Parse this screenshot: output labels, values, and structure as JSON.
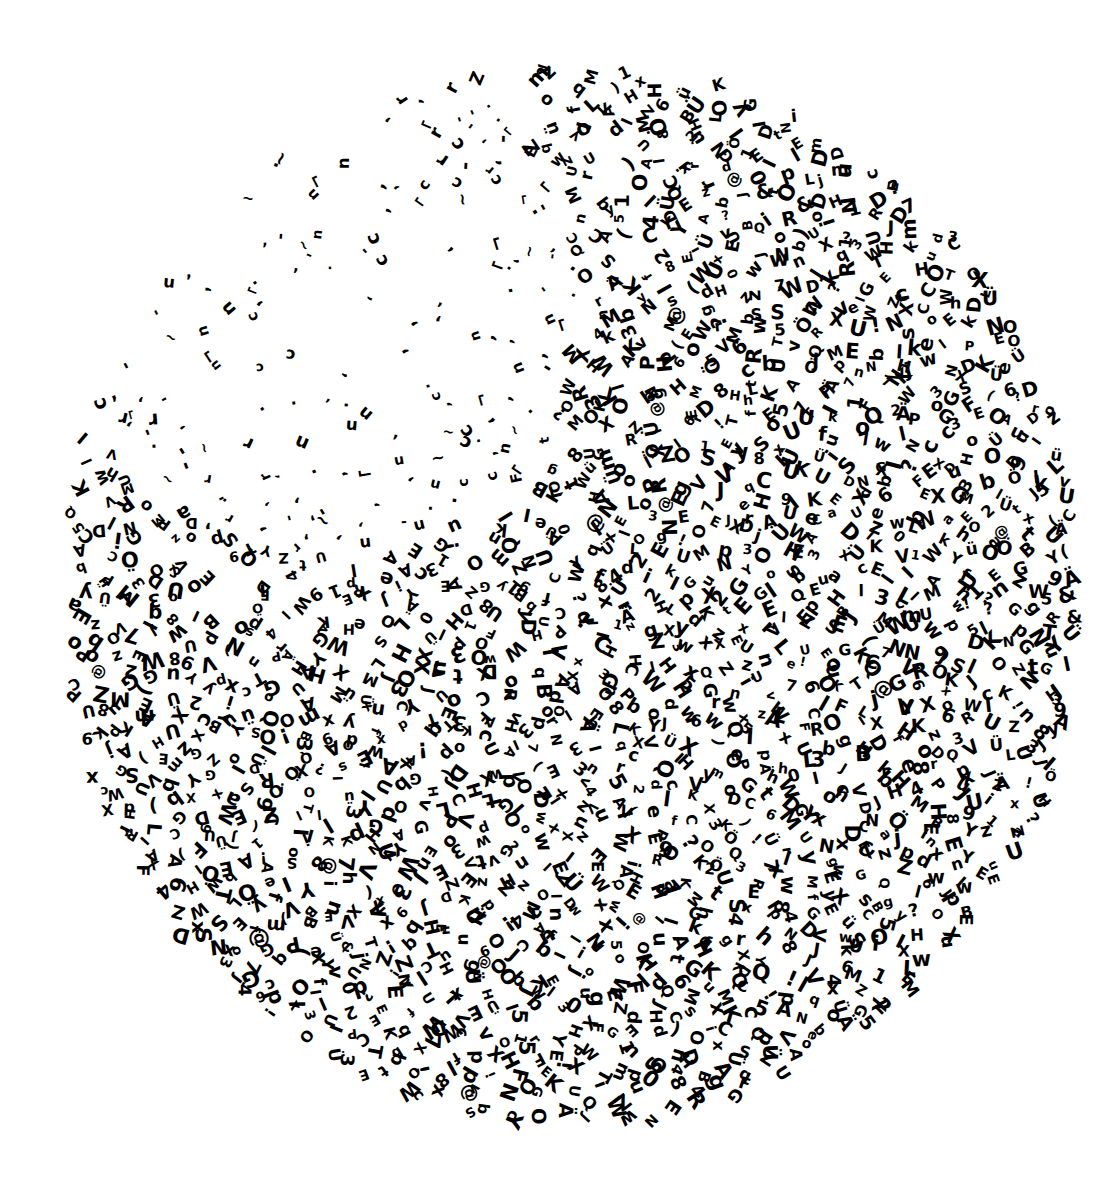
{
  "artwork": {
    "title": "Typographic circle",
    "background_color": "#ffffff",
    "ink_color": "#000000",
    "shape": {
      "type": "ellipse",
      "cx": 573,
      "cy": 595,
      "rx": 512,
      "ry": 530
    },
    "glyph_pool": "ABCDEFGHIJKLMNOPQRSTUVWXYZabcdefghijklmnopqrstuvwxyz0123456789!?()&@ÜüÖÄ",
    "visible_fragments": [
      "xpndx",
      "Nol",
      "Gu",
      "E",
      "K",
      "Y",
      "A",
      "XUlUW",
      "Ell",
      "IDI",
      "OW",
      "wOOM",
      "HD",
      "XH",
      "CEJ",
      "Ao",
      "ÜU",
      "GH",
      "Z",
      "Ü",
      "SV",
      "N",
      "Q",
      "3",
      "Lb",
      "E!",
      "K"
    ],
    "density": {
      "sparse_region_center": [
        330,
        300
      ],
      "sparse_region_radius": 420,
      "dense_base": 1.0,
      "sparse_min": 0.25,
      "cell_size": 19
    },
    "glyph_size": {
      "min": 13,
      "max": 22
    }
  }
}
